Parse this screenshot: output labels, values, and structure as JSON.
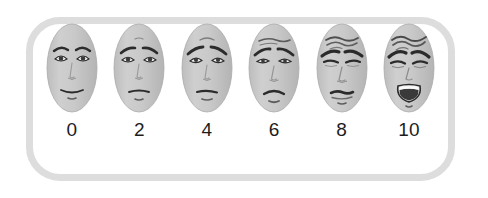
{
  "scale": {
    "name": "Faces Pain Rating Scale",
    "frame_color": "#dddddd",
    "background_color": "#ffffff",
    "face_fill_color": "#c7c7c7",
    "line_color": "#2b2b2b",
    "label_color": "#1d1d1d",
    "faces": [
      {
        "label": "0",
        "expression": "neutral-smiling",
        "brows": "relaxed-arched",
        "eyes": "open",
        "mouth": "slight-smile",
        "forehead_wrinkles": 0
      },
      {
        "label": "2",
        "expression": "slightly-worried",
        "brows": "inner-raised",
        "eyes": "open",
        "mouth": "small-frown",
        "forehead_wrinkles": 1
      },
      {
        "label": "4",
        "expression": "worried",
        "brows": "angled-down-outer",
        "eyes": "open-drooping",
        "mouth": "flat-frown",
        "forehead_wrinkles": 1
      },
      {
        "label": "6",
        "expression": "distressed-frowning",
        "brows": "furrowed",
        "eyes": "narrowed",
        "mouth": "deep-frown",
        "forehead_wrinkles": 2
      },
      {
        "label": "8",
        "expression": "grimacing",
        "brows": "tightly-furrowed",
        "eyes": "nearly-closed",
        "mouth": "pressed-grimace",
        "forehead_wrinkles": 3
      },
      {
        "label": "10",
        "expression": "crying-screaming",
        "brows": "tightly-furrowed",
        "eyes": "squeezed-shut",
        "mouth": "wide-open-crying",
        "forehead_wrinkles": 3
      }
    ]
  }
}
